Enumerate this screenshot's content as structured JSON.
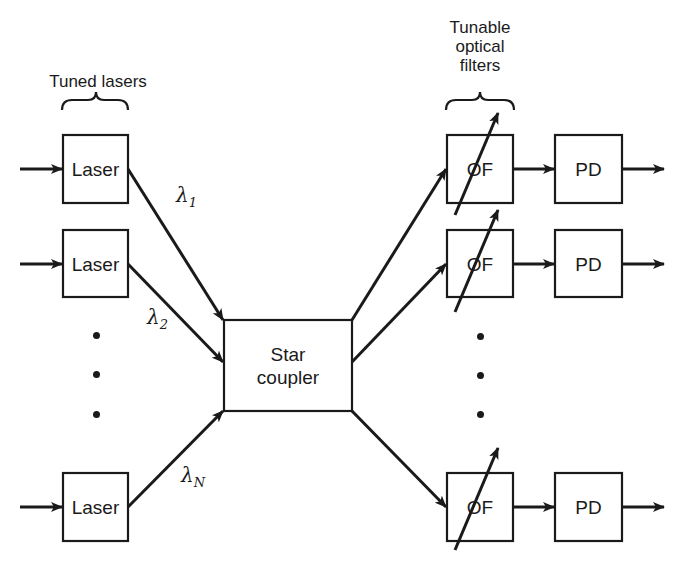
{
  "diagram": {
    "type": "WDM broadcast-and-select network",
    "headers": {
      "tuned_lasers": "Tuned lasers",
      "tunable_filters_line1": "Tunable",
      "tunable_filters_line2": "optical",
      "tunable_filters_line3": "filters"
    },
    "transmitters": [
      {
        "label": "Laser",
        "wavelength": "λ",
        "sub": "1"
      },
      {
        "label": "Laser",
        "wavelength": "λ",
        "sub": "2"
      },
      {
        "label": "Laser",
        "wavelength": "λ",
        "sub": "N"
      }
    ],
    "coupler": {
      "line1": "Star",
      "line2": "coupler"
    },
    "receivers": [
      {
        "filter": "OF",
        "detector": "PD"
      },
      {
        "filter": "OF",
        "detector": "PD"
      },
      {
        "filter": "OF",
        "detector": "PD"
      }
    ],
    "ellipsis": "⋮",
    "colors": {
      "ink": "#1a1a1a",
      "background": "#ffffff"
    }
  }
}
